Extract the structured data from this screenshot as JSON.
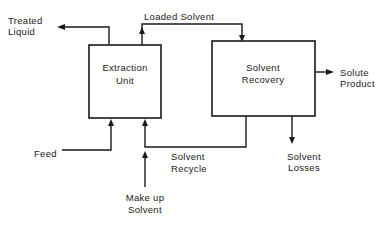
{
  "diagram": {
    "type": "process-flow",
    "units": {
      "extraction": {
        "line1": "Extraction",
        "line2": "Unit"
      },
      "recovery": {
        "line1": "Solvent",
        "line2": "Recovery"
      }
    },
    "streams": {
      "treated_liquid": {
        "line1": "Treated",
        "line2": "Liquid"
      },
      "loaded_solvent": {
        "label": "Loaded Solvent"
      },
      "solute_product": {
        "line1": "Solute",
        "line2": "Product"
      },
      "feed": {
        "label": "Feed"
      },
      "solvent_recycle": {
        "line1": "Solvent",
        "line2": "Recycle"
      },
      "solvent_losses": {
        "line1": "Solvent",
        "line2": "Losses"
      },
      "makeup_solvent": {
        "line1": "Make up",
        "line2": "Solvent"
      }
    },
    "colors": {
      "ink": "#1a1a1a",
      "background": "#ffffff"
    }
  }
}
